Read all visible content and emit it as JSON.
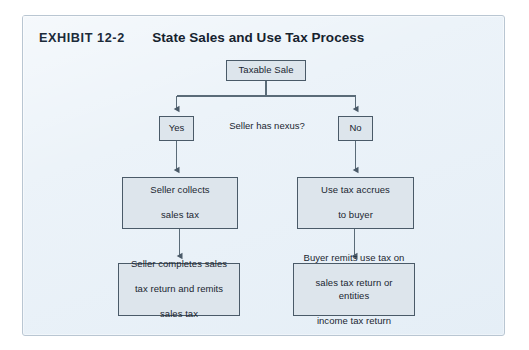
{
  "exhibit": {
    "label": "EXHIBIT 12-2",
    "title": "State Sales and Use Tax Process"
  },
  "colors": {
    "panel_background": "#e9f1f8",
    "panel_border": "#b9c6d2",
    "node_fill": "#dde5ec",
    "node_border": "#4a5a68",
    "connector": "#5a6b78",
    "text": "#1a2630"
  },
  "flowchart": {
    "type": "flowchart",
    "orientation": "top-down",
    "nodes": [
      {
        "id": "taxable-sale",
        "label": "Taxable Sale"
      },
      {
        "id": "yes",
        "label": "Yes"
      },
      {
        "id": "no",
        "label": "No"
      },
      {
        "id": "seller-collects",
        "line1": "Seller collects",
        "line2": "sales tax"
      },
      {
        "id": "use-tax-accrues",
        "line1": "Use tax accrues",
        "line2": "to buyer"
      },
      {
        "id": "seller-completes",
        "line1": "Seller completes sales",
        "line2": "tax return and remits",
        "line3": "sales tax"
      },
      {
        "id": "buyer-remits",
        "line1": "Buyer remits use tax on",
        "line2": "sales tax return or entities",
        "line3": "income tax return"
      }
    ],
    "decision_label": "Seller has nexus?",
    "edges": [
      {
        "from": "taxable-sale",
        "to": "yes"
      },
      {
        "from": "taxable-sale",
        "to": "no"
      },
      {
        "from": "yes",
        "to": "seller-collects"
      },
      {
        "from": "no",
        "to": "use-tax-accrues"
      },
      {
        "from": "seller-collects",
        "to": "seller-completes"
      },
      {
        "from": "use-tax-accrues",
        "to": "buyer-remits"
      }
    ]
  }
}
